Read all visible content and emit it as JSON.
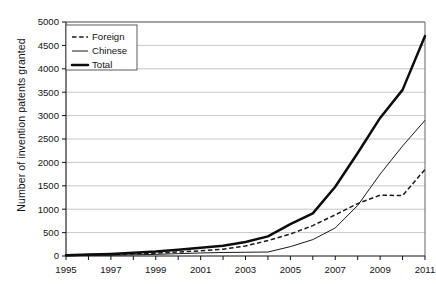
{
  "chart_data": {
    "type": "line",
    "title": "",
    "xlabel": "",
    "ylabel": "Number of invention patents granted",
    "x": [
      1995,
      1996,
      1997,
      1998,
      1999,
      2000,
      2001,
      2002,
      2003,
      2004,
      2005,
      2006,
      2007,
      2008,
      2009,
      2010,
      2011
    ],
    "xlim": [
      1995,
      2011
    ],
    "ylim": [
      0,
      5000
    ],
    "ytick_step": 500,
    "xtick_labels": [
      "1995",
      "1997",
      "1999",
      "2001",
      "2003",
      "2005",
      "2007",
      "2009",
      "2011"
    ],
    "xtick_values": [
      1995,
      1997,
      1999,
      2001,
      2003,
      2005,
      2007,
      2009,
      2011
    ],
    "ytick_labels": [
      "0",
      "500",
      "1000",
      "1500",
      "2000",
      "2500",
      "3000",
      "3500",
      "4000",
      "4500",
      "5000"
    ],
    "ytick_values": [
      0,
      500,
      1000,
      1500,
      2000,
      2500,
      3000,
      3500,
      4000,
      4500,
      5000
    ],
    "grid": true,
    "grid_axis": "y",
    "legend_position": "top-left",
    "series": [
      {
        "name": "Foreign",
        "style": "dashed",
        "values": [
          10,
          20,
          30,
          45,
          60,
          85,
          110,
          145,
          215,
          330,
          470,
          650,
          880,
          1120,
          1300,
          1290,
          1850
        ]
      },
      {
        "name": "Chinese",
        "style": "thin-solid",
        "values": [
          5,
          10,
          15,
          25,
          35,
          50,
          65,
          75,
          80,
          85,
          200,
          350,
          600,
          1080,
          1750,
          2350,
          2900
        ]
      },
      {
        "name": "Total",
        "style": "thick-solid",
        "values": [
          15,
          30,
          45,
          70,
          95,
          135,
          175,
          220,
          300,
          420,
          680,
          910,
          1480,
          2200,
          2950,
          3550,
          4700
        ]
      }
    ]
  },
  "legend": {
    "entries": [
      {
        "label": "Foreign",
        "style": "dashed"
      },
      {
        "label": "Chinese",
        "style": "thin-solid"
      },
      {
        "label": "Total",
        "style": "thick-solid"
      }
    ]
  },
  "colors": {
    "background": "#ffffff",
    "ink": "#1a1a1a",
    "grid": "#b9b9b9",
    "frame": "#555555"
  }
}
